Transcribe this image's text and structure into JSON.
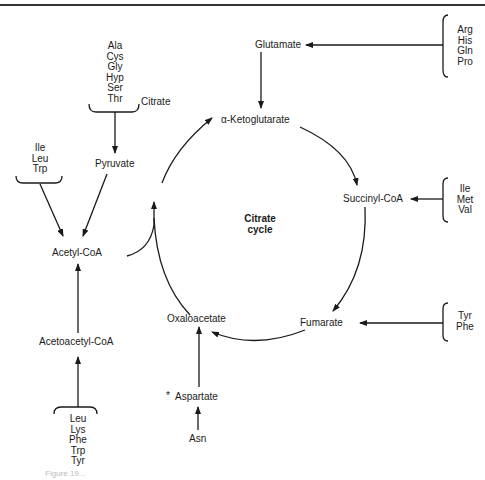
{
  "diagram": {
    "center_label": [
      "Citrate",
      "cycle"
    ],
    "cycle_intermediates": {
      "citrate": "Citrate",
      "alpha_ketoglutarate": "α-Ketoglutarate",
      "succinyl_coa": "Succinyl-CoA",
      "fumarate": "Fumarate",
      "oxaloacetate": "Oxaloacetate"
    },
    "entry_metabolites": {
      "glutamate": "Glutamate",
      "pyruvate": "Pyruvate",
      "acetyl_coa": "Acetyl-CoA",
      "acetoacetyl_coa": "Acetoacetyl-CoA",
      "aspartate": "Aspartate",
      "aspartate_mark": "*"
    },
    "amino_acid_groups": {
      "to_pyruvate": [
        "Ala",
        "Cys",
        "Gly",
        "Hyp",
        "Ser",
        "Thr"
      ],
      "to_acetyl_coa": [
        "Ile",
        "Leu",
        "Trp"
      ],
      "to_acetoacetyl_coa": [
        "Leu",
        "Lys",
        "Phe",
        "Trp",
        "Tyr"
      ],
      "to_glutamate": [
        "Arg",
        "His",
        "Gln",
        "Pro"
      ],
      "to_succinyl_coa": [
        "Ile",
        "Met",
        "Val"
      ],
      "to_fumarate": [
        "Tyr",
        "Phe"
      ],
      "to_aspartate": "Asn"
    },
    "caption": "Figure 19..."
  }
}
